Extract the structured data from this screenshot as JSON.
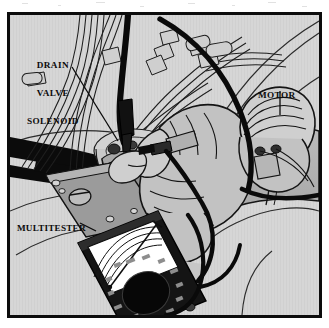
{
  "figure": {
    "kind": "technical-line-illustration",
    "background_color": "#d6d6d6",
    "ink_color": "#0b0b0b",
    "frame_color": "#0c0c0c",
    "paper_color": "#ffffff"
  },
  "labels": {
    "solenoid": {
      "text": "DRAIN\nVALVE\nSOLENOID",
      "line1": "DRAIN",
      "line2": "VALVE",
      "line3": "SOLENOID"
    },
    "motor": {
      "text": "MOTOR"
    },
    "multitester": {
      "text": "MULTITESTER"
    }
  },
  "callouts": [
    {
      "name": "solenoid-leader",
      "from_label": "DRAIN VALVE SOLENOID",
      "points_to": "solenoid body at center-left"
    },
    {
      "name": "motor-leader",
      "from_label": "MOTOR",
      "points_to": "motor housing at upper right"
    },
    {
      "name": "multitester-leader",
      "from_label": "MULTITESTER",
      "points_to": "meter case at lower left"
    }
  ],
  "parts": [
    {
      "name": "drain-valve-solenoid",
      "description": "cylindrical solenoid coil on mounting bracket"
    },
    {
      "name": "solenoid-mounting-bracket",
      "description": "flat plate with screw"
    },
    {
      "name": "motor",
      "description": "ribbed motor housing with terminal posts"
    },
    {
      "name": "multitester",
      "description": "analog volt-ohm meter with arc scale, needle and rotary range knob"
    },
    {
      "name": "meter-dial-face",
      "description": "white scale plate with four curved arcs and pointer needle"
    },
    {
      "name": "range-selector-knob",
      "description": "large black round dial"
    },
    {
      "name": "test-lead-black",
      "description": "black probe cable running up to the solenoid terminals"
    },
    {
      "name": "test-lead-red",
      "description": "second probe cable looping toward the terminals"
    },
    {
      "name": "hand",
      "description": "technician hand holding the test probe at the solenoid terminals"
    },
    {
      "name": "forearm",
      "description": "technician forearm entering from the right"
    },
    {
      "name": "wire-harness",
      "description": "bundle of wires and connectors across the top of the frame"
    },
    {
      "name": "drain-hose",
      "description": "dark hose crossing the left side"
    },
    {
      "name": "tub-outline",
      "description": "curved background lines of the washer tub"
    }
  ],
  "meter": {
    "arc_count": 4,
    "needle_angle_deg": -62,
    "face_color": "#ffffff",
    "case_color": "#121212",
    "knob_color": "#0a0a0a"
  }
}
